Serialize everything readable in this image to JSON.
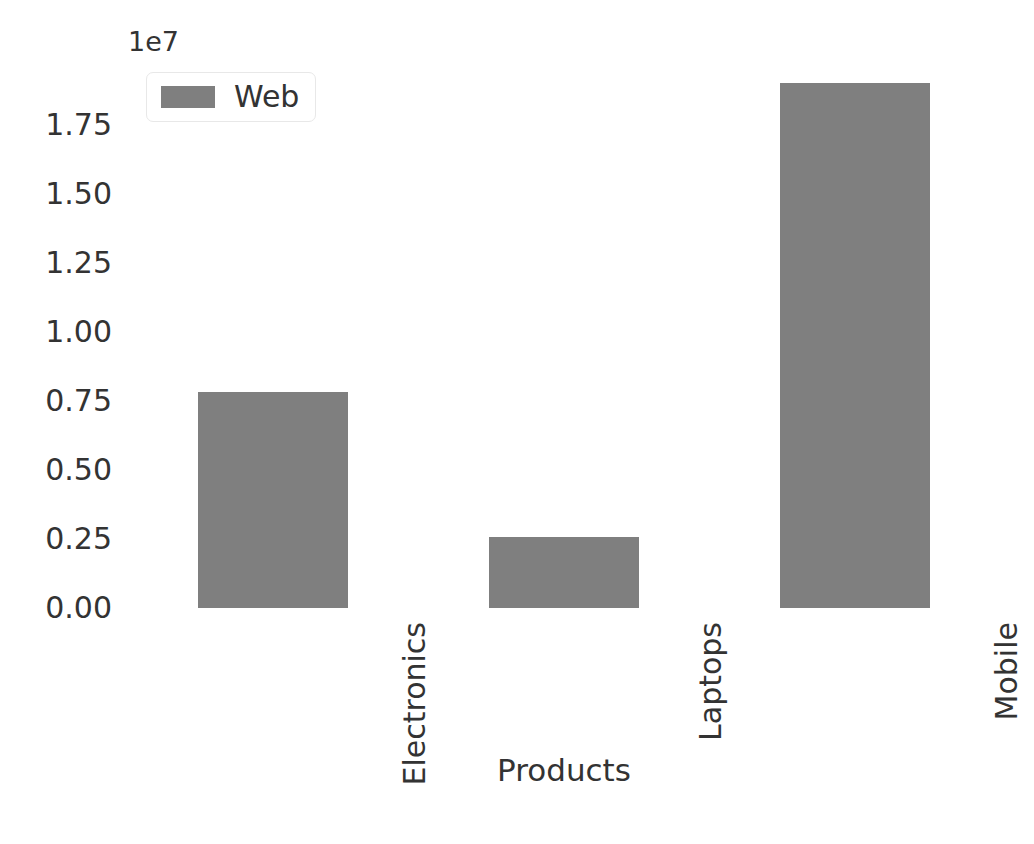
{
  "chart_data": {
    "type": "bar",
    "title": "",
    "subtitle": "",
    "xlabel": "Products",
    "ylabel": "",
    "categories": [
      "Electronics",
      "Laptops",
      "Mobile"
    ],
    "series": [
      {
        "name": "Web",
        "values": [
          7600000,
          2500000,
          18500000
        ]
      }
    ],
    "values": [
      7600000,
      2500000,
      18500000
    ],
    "ylim": [
      0,
      19300000
    ],
    "yticks": [
      0,
      2500000,
      5000000,
      7500000,
      10000000,
      12500000,
      15000000,
      17500000
    ],
    "ytick_labels": [
      "0.00",
      "0.25",
      "0.50",
      "0.75",
      "1.00",
      "1.25",
      "1.50",
      "1.75"
    ],
    "y_offset_text": "1e7",
    "y_offset_multiplier": 10000000,
    "grid": false,
    "legend": {
      "position": "upper left",
      "entries": [
        {
          "label": "Web",
          "color": "#7f7f7f"
        }
      ]
    },
    "xtick_rotation": 90,
    "bar_color": "#7f7f7f",
    "background_color": "#ffffff",
    "text_color": "#333333"
  },
  "axis": {
    "y_offset_label": "1e7",
    "x_title": "Products",
    "y_tick_labels": [
      "1.75",
      "1.50",
      "1.25",
      "1.00",
      "0.75",
      "0.50",
      "0.25",
      "0.00"
    ],
    "x_tick_labels": [
      "Electronics",
      "Laptops",
      "Mobile"
    ]
  },
  "legend": {
    "items": [
      {
        "label": "Web",
        "color": "#7f7f7f"
      }
    ]
  }
}
